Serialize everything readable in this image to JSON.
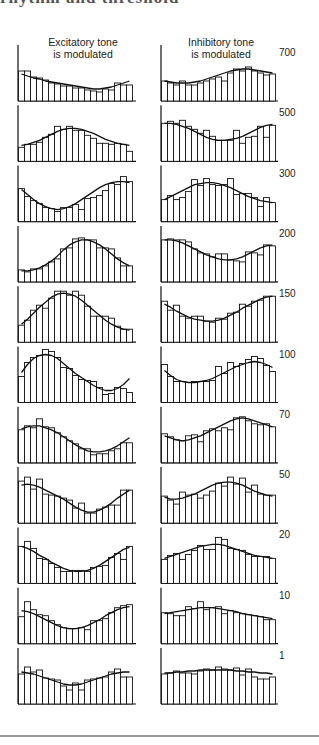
{
  "figure": {
    "title_partial": "rhythm and threshold",
    "column_headers": [
      {
        "line1": "Excitatory tone",
        "line2": "is modulated"
      },
      {
        "line1": "Inhibitory tone",
        "line2": "is modulated"
      }
    ],
    "row_labels": [
      "700",
      "500",
      "300",
      "200",
      "150",
      "100",
      "70",
      "50",
      "20",
      "10",
      "1"
    ]
  },
  "chart_data": {
    "type": "bar",
    "layout": "small multiples: 11 rows x 2 columns; each panel a histogram of 19 bins with fitted sinusoid curve",
    "xlabel": "",
    "ylabel": "",
    "row_labels": [
      "700",
      "500",
      "300",
      "200",
      "150",
      "100",
      "70",
      "50",
      "20",
      "10",
      "1"
    ],
    "bins": 19,
    "grid": false,
    "legend": null,
    "panels": [
      {
        "row": "700",
        "column": "Excitatory tone is modulated",
        "values": [
          30,
          30,
          24,
          23,
          21,
          18,
          17,
          15,
          15,
          13,
          13,
          11,
          10,
          9,
          12,
          11,
          18,
          16,
          16
        ]
      },
      {
        "row": "700",
        "column": "Inhibitory tone is modulated",
        "values": [
          20,
          18,
          16,
          20,
          16,
          16,
          18,
          20,
          22,
          24,
          20,
          28,
          32,
          30,
          34,
          30,
          28,
          26,
          27
        ]
      },
      {
        "row": "500",
        "column": "Excitatory tone is modulated",
        "values": [
          14,
          17,
          17,
          19,
          24,
          27,
          35,
          32,
          35,
          31,
          31,
          26,
          23,
          18,
          18,
          17,
          18,
          17,
          10
        ]
      },
      {
        "row": "500",
        "column": "Inhibitory tone is modulated",
        "values": [
          38,
          40,
          38,
          41,
          35,
          32,
          28,
          31,
          25,
          21,
          21,
          21,
          31,
          18,
          24,
          25,
          35,
          24,
          36
        ]
      },
      {
        "row": "300",
        "column": "Excitatory tone is modulated",
        "values": [
          33,
          25,
          21,
          18,
          14,
          13,
          10,
          14,
          14,
          17,
          12,
          23,
          24,
          26,
          31,
          38,
          37,
          45,
          40
        ]
      },
      {
        "row": "300",
        "column": "Inhibitory tone is modulated",
        "values": [
          22,
          26,
          22,
          24,
          30,
          42,
          36,
          43,
          37,
          36,
          37,
          43,
          27,
          28,
          28,
          24,
          15,
          24,
          19
        ]
      },
      {
        "row": "200",
        "column": "Excitatory tone is modulated",
        "values": [
          12,
          10,
          13,
          13,
          16,
          20,
          23,
          33,
          34,
          43,
          44,
          42,
          42,
          34,
          34,
          33,
          24,
          16,
          16
        ]
      },
      {
        "row": "200",
        "column": "Inhibitory tone is modulated",
        "values": [
          42,
          43,
          42,
          42,
          40,
          33,
          29,
          28,
          25,
          28,
          28,
          22,
          21,
          20,
          30,
          29,
          27,
          37,
          36
        ]
      },
      {
        "row": "150",
        "column": "Excitatory tone is modulated",
        "values": [
          17,
          22,
          32,
          37,
          34,
          44,
          51,
          51,
          47,
          51,
          47,
          36,
          26,
          26,
          26,
          24,
          16,
          13,
          13
        ]
      },
      {
        "row": "150",
        "column": "Inhibitory tone is modulated",
        "values": [
          41,
          32,
          37,
          26,
          24,
          26,
          26,
          21,
          20,
          24,
          23,
          29,
          30,
          38,
          36,
          41,
          42,
          46,
          46
        ]
      },
      {
        "row": "100",
        "column": "Excitatory tone is modulated",
        "values": [
          26,
          40,
          45,
          47,
          53,
          51,
          45,
          35,
          34,
          27,
          23,
          22,
          21,
          15,
          8,
          9,
          15,
          14,
          10
        ]
      },
      {
        "row": "100",
        "column": "Inhibitory tone is modulated",
        "values": [
          38,
          26,
          21,
          21,
          20,
          21,
          21,
          21,
          22,
          36,
          29,
          40,
          36,
          39,
          43,
          46,
          44,
          37,
          31
        ]
      },
      {
        "row": "70",
        "column": "Excitatory tone is modulated",
        "values": [
          33,
          37,
          35,
          44,
          36,
          35,
          30,
          26,
          22,
          19,
          14,
          14,
          8,
          9,
          9,
          12,
          14,
          20,
          20
        ]
      },
      {
        "row": "70",
        "column": "Inhibitory tone is modulated",
        "values": [
          29,
          26,
          23,
          22,
          27,
          28,
          21,
          32,
          34,
          32,
          35,
          33,
          45,
          46,
          42,
          39,
          38,
          39,
          36
        ]
      },
      {
        "row": "50",
        "column": "Excitatory tone is modulated",
        "values": [
          42,
          46,
          34,
          44,
          29,
          28,
          27,
          25,
          23,
          15,
          20,
          10,
          10,
          14,
          16,
          18,
          18,
          33,
          33
        ]
      },
      {
        "row": "50",
        "column": "Inhibitory tone is modulated",
        "values": [
          27,
          23,
          19,
          31,
          28,
          29,
          25,
          28,
          32,
          40,
          37,
          46,
          39,
          45,
          31,
          38,
          29,
          28,
          28
        ]
      },
      {
        "row": "20",
        "column": "Excitatory tone is modulated",
        "values": [
          37,
          42,
          35,
          25,
          24,
          20,
          16,
          12,
          12,
          13,
          13,
          12,
          16,
          17,
          18,
          26,
          30,
          24,
          37
        ]
      },
      {
        "row": "20",
        "column": "Inhibitory tone is modulated",
        "values": [
          24,
          28,
          30,
          24,
          29,
          33,
          38,
          34,
          34,
          46,
          44,
          35,
          34,
          33,
          29,
          27,
          27,
          27,
          25
        ]
      },
      {
        "row": "10",
        "column": "Excitatory tone is modulated",
        "values": [
          27,
          42,
          34,
          29,
          28,
          23,
          19,
          16,
          15,
          15,
          16,
          14,
          23,
          23,
          25,
          31,
          36,
          38,
          39
        ]
      },
      {
        "row": "10",
        "column": "Inhibitory tone is modulated",
        "values": [
          31,
          30,
          28,
          28,
          37,
          35,
          42,
          34,
          36,
          37,
          30,
          33,
          31,
          30,
          29,
          28,
          27,
          24,
          24
        ]
      },
      {
        "row": "1",
        "column": "Excitatory tone is modulated",
        "values": [
          30,
          37,
          32,
          34,
          26,
          25,
          24,
          18,
          14,
          21,
          14,
          24,
          25,
          26,
          27,
          32,
          35,
          27,
          27
        ]
      },
      {
        "row": "1",
        "column": "Inhibitory tone is modulated",
        "values": [
          30,
          31,
          33,
          31,
          31,
          30,
          33,
          35,
          34,
          37,
          35,
          34,
          36,
          29,
          35,
          27,
          25,
          25,
          27
        ]
      }
    ],
    "fit_curves": [
      {
        "row": "700",
        "column": "Excitatory tone is modulated",
        "values": [
          27,
          25,
          23,
          22,
          20,
          19,
          18,
          17,
          16,
          15,
          14,
          13,
          12,
          12,
          13,
          14,
          16,
          18,
          20
        ]
      },
      {
        "row": "700",
        "column": "Inhibitory tone is modulated",
        "values": [
          20,
          19,
          18,
          18,
          18,
          19,
          20,
          22,
          24,
          26,
          28,
          30,
          31,
          32,
          32,
          31,
          30,
          29,
          28
        ]
      },
      {
        "row": "500",
        "column": "Excitatory tone is modulated",
        "values": [
          16,
          17,
          19,
          21,
          24,
          27,
          30,
          32,
          33,
          33,
          32,
          30,
          28,
          25,
          22,
          20,
          18,
          17,
          16
        ]
      },
      {
        "row": "500",
        "column": "Inhibitory tone is modulated",
        "values": [
          38,
          38,
          37,
          35,
          33,
          30,
          27,
          24,
          22,
          21,
          21,
          22,
          23,
          25,
          28,
          31,
          34,
          36,
          37
        ]
      },
      {
        "row": "300",
        "column": "Excitatory tone is modulated",
        "values": [
          32,
          27,
          22,
          18,
          15,
          13,
          12,
          13,
          15,
          18,
          22,
          26,
          30,
          34,
          37,
          39,
          40,
          40,
          39
        ]
      },
      {
        "row": "300",
        "column": "Inhibitory tone is modulated",
        "values": [
          22,
          25,
          28,
          31,
          34,
          37,
          38,
          39,
          39,
          38,
          36,
          34,
          31,
          28,
          25,
          23,
          21,
          20,
          19
        ]
      },
      {
        "row": "200",
        "column": "Excitatory tone is modulated",
        "values": [
          11,
          11,
          12,
          14,
          17,
          21,
          26,
          32,
          37,
          40,
          42,
          42,
          40,
          37,
          33,
          28,
          23,
          19,
          16
        ]
      },
      {
        "row": "200",
        "column": "Inhibitory tone is modulated",
        "values": [
          42,
          42,
          41,
          39,
          36,
          33,
          30,
          27,
          25,
          23,
          22,
          22,
          23,
          25,
          28,
          31,
          34,
          36,
          37
        ]
      },
      {
        "row": "150",
        "column": "Excitatory tone is modulated",
        "values": [
          18,
          23,
          29,
          35,
          40,
          45,
          48,
          49,
          48,
          46,
          42,
          37,
          32,
          27,
          22,
          18,
          15,
          13,
          12
        ]
      },
      {
        "row": "150",
        "column": "Inhibitory tone is modulated",
        "values": [
          38,
          35,
          31,
          28,
          25,
          23,
          22,
          21,
          21,
          22,
          24,
          27,
          30,
          34,
          37,
          40,
          43,
          45,
          46
        ]
      },
      {
        "row": "100",
        "column": "Excitatory tone is modulated",
        "values": [
          30,
          38,
          44,
          47,
          48,
          47,
          44,
          39,
          34,
          29,
          25,
          21,
          17,
          14,
          12,
          12,
          14,
          18,
          24
        ]
      },
      {
        "row": "100",
        "column": "Inhibitory tone is modulated",
        "values": [
          32,
          27,
          23,
          21,
          20,
          20,
          21,
          22,
          24,
          27,
          30,
          33,
          36,
          38,
          40,
          41,
          40,
          38,
          35
        ]
      },
      {
        "row": "70",
        "column": "Excitatory tone is modulated",
        "values": [
          34,
          36,
          37,
          37,
          35,
          33,
          30,
          26,
          22,
          18,
          15,
          12,
          11,
          11,
          12,
          14,
          17,
          21,
          25
        ]
      },
      {
        "row": "70",
        "column": "Inhibitory tone is modulated",
        "values": [
          27,
          25,
          23,
          22,
          23,
          25,
          27,
          30,
          33,
          36,
          39,
          42,
          44,
          45,
          44,
          42,
          40,
          38,
          36
        ]
      },
      {
        "row": "50",
        "column": "Excitatory tone is modulated",
        "values": [
          38,
          39,
          38,
          36,
          33,
          30,
          27,
          24,
          20,
          16,
          13,
          11,
          11,
          13,
          16,
          20,
          25,
          29,
          33
        ]
      },
      {
        "row": "50",
        "column": "Inhibitory tone is modulated",
        "values": [
          26,
          24,
          24,
          25,
          27,
          29,
          32,
          35,
          38,
          40,
          41,
          41,
          40,
          38,
          35,
          32,
          30,
          28,
          27
        ]
      },
      {
        "row": "20",
        "column": "Excitatory tone is modulated",
        "values": [
          37,
          35,
          32,
          28,
          25,
          21,
          18,
          15,
          13,
          12,
          12,
          13,
          15,
          18,
          22,
          26,
          30,
          34,
          36
        ]
      },
      {
        "row": "20",
        "column": "Inhibitory tone is modulated",
        "values": [
          25,
          27,
          29,
          31,
          33,
          35,
          37,
          38,
          39,
          39,
          38,
          36,
          34,
          32,
          30,
          28,
          27,
          26,
          25
        ]
      },
      {
        "row": "10",
        "column": "Excitatory tone is modulated",
        "values": [
          33,
          32,
          30,
          27,
          24,
          21,
          18,
          16,
          15,
          15,
          16,
          18,
          21,
          24,
          28,
          31,
          34,
          36,
          37
        ]
      },
      {
        "row": "10",
        "column": "Inhibitory tone is modulated",
        "values": [
          30,
          31,
          32,
          33,
          34,
          35,
          36,
          36,
          36,
          35,
          34,
          33,
          32,
          30,
          29,
          28,
          27,
          26,
          25
        ]
      },
      {
        "row": "1",
        "column": "Excitatory tone is modulated",
        "values": [
          32,
          31,
          30,
          28,
          26,
          24,
          22,
          20,
          19,
          19,
          20,
          22,
          24,
          26,
          28,
          30,
          31,
          32,
          32
        ]
      },
      {
        "row": "1",
        "column": "Inhibitory tone is modulated",
        "values": [
          31,
          31,
          32,
          32,
          33,
          33,
          34,
          34,
          34,
          34,
          34,
          34,
          33,
          33,
          32,
          32,
          31,
          31,
          30
        ]
      }
    ]
  }
}
